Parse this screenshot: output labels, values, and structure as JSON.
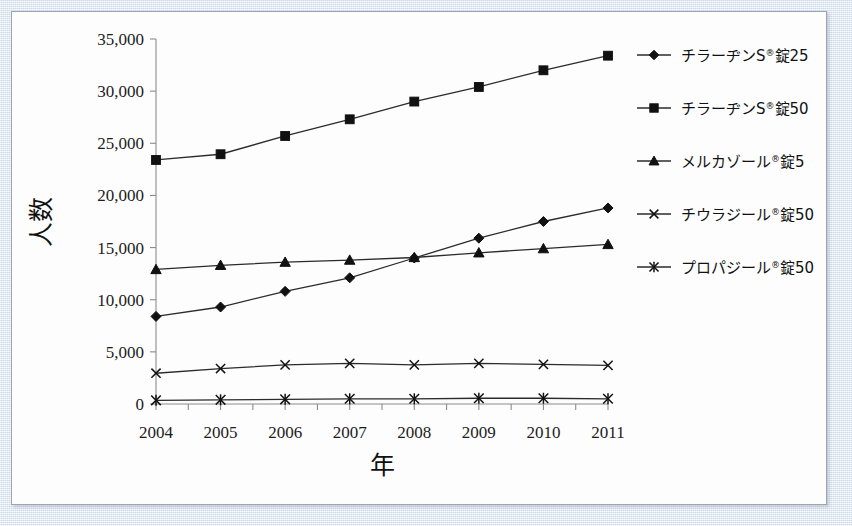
{
  "chart_data": {
    "type": "line",
    "title": "",
    "xlabel": "年",
    "ylabel": "人数",
    "categories": [
      "2004",
      "2005",
      "2006",
      "2007",
      "2008",
      "2009",
      "2010",
      "2011"
    ],
    "x": [
      2004,
      2005,
      2006,
      2007,
      2008,
      2009,
      2010,
      2011
    ],
    "xlim": [
      2004,
      2011
    ],
    "ylim": [
      0,
      35000
    ],
    "ytick_values": [
      0,
      5000,
      10000,
      15000,
      20000,
      25000,
      30000,
      35000
    ],
    "ytick_labels": [
      "0",
      "5,000",
      "10,000",
      "15,000",
      "20,000",
      "25,000",
      "30,000",
      "35,000"
    ],
    "grid": false,
    "legend_position": "right",
    "series": [
      {
        "name": "チラーヂンS®錠25",
        "marker": "diamond",
        "values": [
          8400,
          9300,
          10800,
          12100,
          14000,
          15900,
          17500,
          18800
        ]
      },
      {
        "name": "チラーヂンS®錠50",
        "marker": "square",
        "values": [
          23400,
          23950,
          25700,
          27300,
          29000,
          30400,
          32000,
          33400
        ]
      },
      {
        "name": "メルカゾール®錠5",
        "marker": "triangle",
        "values": [
          12900,
          13300,
          13600,
          13800,
          14050,
          14500,
          14900,
          15300
        ]
      },
      {
        "name": "チウラジール®錠50",
        "marker": "cross",
        "values": [
          2950,
          3400,
          3750,
          3900,
          3750,
          3900,
          3800,
          3700
        ]
      },
      {
        "name": "プロパジール®錠50",
        "marker": "asterisk",
        "values": [
          350,
          400,
          450,
          500,
          500,
          550,
          550,
          500
        ]
      }
    ]
  },
  "legend": {
    "items": [
      {
        "label_main": "チラーヂンS",
        "reg": "®",
        "label_tail": "錠25",
        "marker": "diamond"
      },
      {
        "label_main": "チラーヂンS",
        "reg": "®",
        "label_tail": "錠50",
        "marker": "square"
      },
      {
        "label_main": "メルカゾール",
        "reg": "®",
        "label_tail": "錠5",
        "marker": "triangle"
      },
      {
        "label_main": "チウラジール",
        "reg": "®",
        "label_tail": "錠50",
        "marker": "cross"
      },
      {
        "label_main": "プロパジール",
        "reg": "®",
        "label_tail": "錠50",
        "marker": "asterisk"
      }
    ]
  },
  "axes": {
    "y_title": "人数",
    "x_title": "年"
  }
}
